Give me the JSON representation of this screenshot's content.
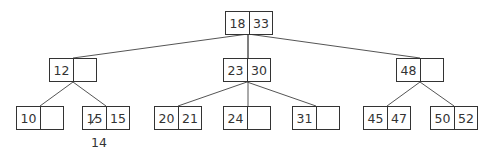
{
  "diagram": {
    "type": "b-tree",
    "root": {
      "id": "n_root",
      "keys": [
        "18",
        "33"
      ],
      "x": 225,
      "y": 11
    },
    "level2": [
      {
        "id": "n_12",
        "keys": [
          "12",
          ""
        ],
        "x": 49,
        "y": 58
      },
      {
        "id": "n_23_30",
        "keys": [
          "23",
          "30"
        ],
        "x": 223,
        "y": 58
      },
      {
        "id": "n_48",
        "keys": [
          "48",
          ""
        ],
        "x": 396,
        "y": 58
      }
    ],
    "level3": [
      {
        "id": "n_10",
        "keys": [
          "10",
          ""
        ],
        "x": 16,
        "y": 106
      },
      {
        "id": "n_15_15",
        "keys": [
          "15",
          "15"
        ],
        "x": 82,
        "y": 106,
        "struck_key_index": 0
      },
      {
        "id": "n_20_21",
        "keys": [
          "20",
          "21"
        ],
        "x": 154,
        "y": 106
      },
      {
        "id": "n_24",
        "keys": [
          "24",
          ""
        ],
        "x": 223,
        "y": 106
      },
      {
        "id": "n_31",
        "keys": [
          "31",
          ""
        ],
        "x": 292,
        "y": 106
      },
      {
        "id": "n_45_47",
        "keys": [
          "45",
          "47"
        ],
        "x": 363,
        "y": 106
      },
      {
        "id": "n_50_52",
        "keys": [
          "50",
          "52"
        ],
        "x": 430,
        "y": 106
      }
    ],
    "annotation": {
      "text": "14",
      "x": 98,
      "y": 137
    },
    "edges": [
      {
        "from": [
          248,
          34
        ],
        "to": [
          73,
          58
        ]
      },
      {
        "from": [
          248,
          34
        ],
        "to": [
          248,
          58
        ]
      },
      {
        "from": [
          248,
          34
        ],
        "to": [
          420,
          58
        ]
      },
      {
        "from": [
          248,
          34
        ],
        "to": [
          248,
          106
        ]
      },
      {
        "from": [
          73,
          82
        ],
        "to": [
          40,
          106
        ]
      },
      {
        "from": [
          73,
          82
        ],
        "to": [
          106,
          106
        ]
      },
      {
        "from": [
          247,
          82
        ],
        "to": [
          178,
          106
        ]
      },
      {
        "from": [
          247,
          82
        ],
        "to": [
          316,
          106
        ]
      },
      {
        "from": [
          420,
          82
        ],
        "to": [
          387,
          106
        ]
      },
      {
        "from": [
          420,
          82
        ],
        "to": [
          454,
          106
        ]
      }
    ],
    "colors": {
      "stroke": "#333333",
      "edge": "#555555",
      "background": "#ffffff"
    }
  }
}
